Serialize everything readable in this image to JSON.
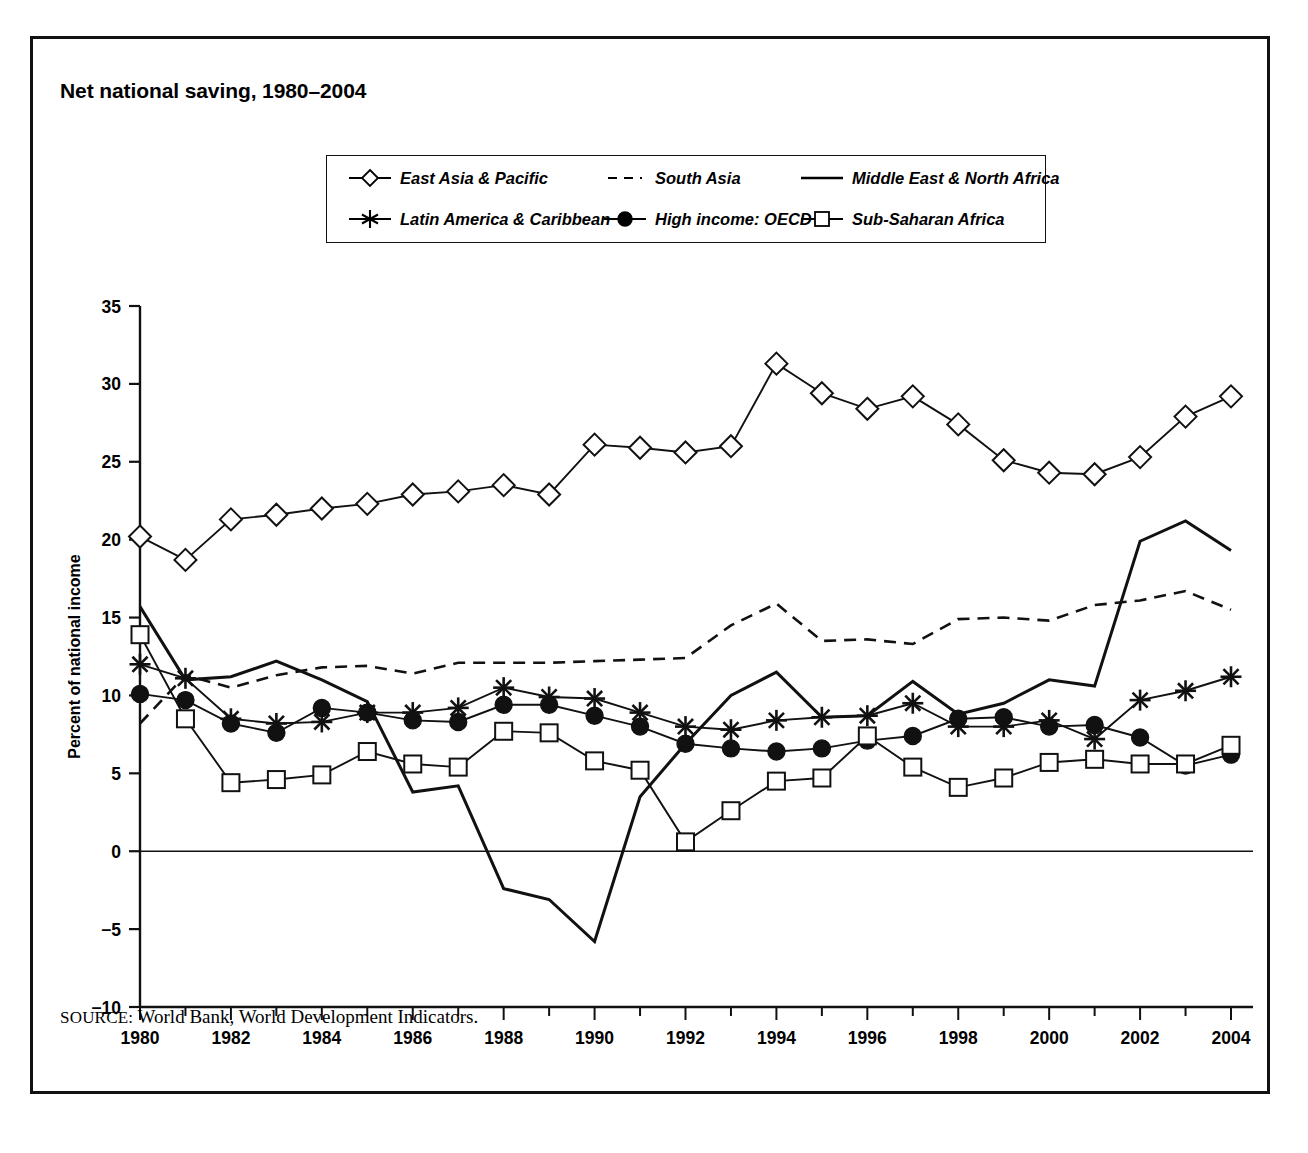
{
  "figure": {
    "title": "Net national saving, 1980–2004",
    "source_keyword": "SOURCE:",
    "source_text": " World Bank, World Development Indicators."
  },
  "legend": {
    "items": [
      {
        "label": "East Asia & Pacific",
        "marker": "diamond-open",
        "line": "solid",
        "icon": "diamond-open-marker-icon"
      },
      {
        "label": "South Asia",
        "marker": "none",
        "line": "dashed",
        "icon": "dashed-line-icon"
      },
      {
        "label": "Middle East & North Africa",
        "marker": "none",
        "line": "solid",
        "icon": "solid-line-icon"
      },
      {
        "label": "Latin America & Caribbean",
        "marker": "asterisk",
        "line": "solid",
        "icon": "asterisk-marker-icon"
      },
      {
        "label": "High income: OECD",
        "marker": "circle-filled",
        "line": "solid",
        "icon": "filled-circle-marker-icon"
      },
      {
        "label": "Sub-Saharan Africa",
        "marker": "square-open",
        "line": "solid",
        "icon": "open-square-marker-icon"
      }
    ]
  },
  "chart_data": {
    "type": "line",
    "title": "Net national saving, 1980–2004",
    "xlabel": "",
    "ylabel": "Percent of national income",
    "xlim": [
      1980,
      2004
    ],
    "ylim": [
      -10,
      35
    ],
    "ytick_step": 5,
    "yticks": [
      -10,
      -5,
      0,
      5,
      10,
      15,
      20,
      25,
      30,
      35
    ],
    "ytick_labels": [
      "−10",
      "−5",
      "0",
      "5",
      "10",
      "15",
      "20",
      "25",
      "30",
      "35"
    ],
    "x": [
      1980,
      1981,
      1982,
      1983,
      1984,
      1985,
      1986,
      1987,
      1988,
      1989,
      1990,
      1991,
      1992,
      1993,
      1994,
      1995,
      1996,
      1997,
      1998,
      1999,
      2000,
      2001,
      2002,
      2003,
      2004
    ],
    "xtick_labels_every": 2,
    "xtick_labels": [
      "1980",
      "1982",
      "1984",
      "1986",
      "1988",
      "1990",
      "1992",
      "1994",
      "1996",
      "1998",
      "2000",
      "2002",
      "2004"
    ],
    "grid": false,
    "legend_position": "top-center",
    "series": [
      {
        "name": "East Asia & Pacific",
        "marker": "diamond-open",
        "line": "solid",
        "values": [
          20.2,
          18.7,
          21.3,
          21.6,
          22.0,
          22.3,
          22.9,
          23.1,
          23.5,
          22.9,
          26.1,
          25.9,
          25.6,
          26.0,
          31.3,
          29.4,
          28.4,
          29.2,
          27.4,
          25.1,
          24.3,
          24.2,
          25.3,
          27.9,
          29.2
        ]
      },
      {
        "name": "South Asia",
        "marker": "none",
        "line": "dashed",
        "values": [
          8.2,
          11.3,
          10.5,
          11.3,
          11.8,
          11.9,
          11.4,
          12.1,
          12.1,
          12.1,
          12.2,
          12.3,
          12.4,
          14.5,
          15.9,
          13.5,
          13.6,
          13.3,
          14.9,
          15.0,
          14.8,
          15.8,
          16.1,
          16.7,
          15.5
        ]
      },
      {
        "name": "Middle East & North Africa",
        "marker": "none",
        "line": "solid",
        "values": [
          15.7,
          11.0,
          11.2,
          12.2,
          11.0,
          9.6,
          3.8,
          4.2,
          -2.4,
          -3.1,
          -5.8,
          3.5,
          6.9,
          10.0,
          11.5,
          8.6,
          8.7,
          10.9,
          8.8,
          9.5,
          11.0,
          10.6,
          19.9,
          21.2,
          19.3
        ]
      },
      {
        "name": "Latin America & Caribbean",
        "marker": "asterisk",
        "line": "solid",
        "values": [
          12.0,
          11.1,
          8.5,
          8.2,
          8.3,
          8.9,
          8.9,
          9.2,
          10.5,
          9.9,
          9.8,
          8.9,
          8.0,
          7.8,
          8.4,
          8.6,
          8.7,
          9.5,
          8.0,
          8.0,
          8.4,
          7.2,
          9.7,
          10.3,
          11.2
        ]
      },
      {
        "name": "High income: OECD",
        "marker": "circle-filled",
        "line": "solid",
        "values": [
          10.1,
          9.7,
          8.2,
          7.6,
          9.2,
          8.9,
          8.4,
          8.3,
          9.4,
          9.4,
          8.7,
          8.0,
          6.9,
          6.6,
          6.4,
          6.6,
          7.1,
          7.4,
          8.5,
          8.6,
          8.0,
          8.1,
          7.3,
          5.5,
          6.2
        ]
      },
      {
        "name": "Sub-Saharan Africa",
        "marker": "square-open",
        "line": "solid",
        "values": [
          13.9,
          8.5,
          4.4,
          4.6,
          4.9,
          6.4,
          5.6,
          5.4,
          7.7,
          7.6,
          5.8,
          5.2,
          0.6,
          2.6,
          4.5,
          4.7,
          7.4,
          5.4,
          4.1,
          4.7,
          5.7,
          5.9,
          5.6,
          5.6,
          6.8
        ]
      }
    ]
  }
}
